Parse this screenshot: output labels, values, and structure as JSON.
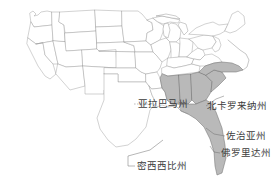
{
  "map": {
    "title": "United States map with highlighted southeastern states",
    "background_color": "#ffffff",
    "outline_color": "#9a9a9a",
    "highlight_fill": "#b9b9b9",
    "highlight_stroke": "#6d6d6d",
    "label_color": "#3c3c3c",
    "labels": [
      {
        "id": "alabama",
        "text": "亚拉巴马州",
        "english": "Alabama",
        "highlighted": true
      },
      {
        "id": "north_carolina",
        "text": "北卡罗来纳州",
        "english": "North Carolina",
        "highlighted": true
      },
      {
        "id": "georgia",
        "text": "佐治亚州",
        "english": "Georgia",
        "highlighted": true
      },
      {
        "id": "florida",
        "text": "佛罗里达州",
        "english": "Florida",
        "highlighted": true
      },
      {
        "id": "mississippi",
        "text": "密西西比州",
        "english": "Mississippi",
        "highlighted": true
      }
    ],
    "highlighted_region": "Southeastern United States",
    "highlighted_count": 5
  }
}
